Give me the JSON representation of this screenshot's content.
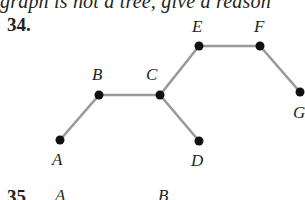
{
  "header_text": "graph is not a tree, give a reason",
  "problem": {
    "number": "34.",
    "nodes": [
      {
        "id": "A",
        "label": "A",
        "x": 60,
        "y": 140,
        "lx": 52,
        "ly": 165
      },
      {
        "id": "B",
        "label": "B",
        "x": 99,
        "y": 95,
        "lx": 92,
        "ly": 80
      },
      {
        "id": "C",
        "label": "C",
        "x": 160,
        "y": 95,
        "lx": 146,
        "ly": 80
      },
      {
        "id": "D",
        "label": "D",
        "x": 199,
        "y": 141,
        "lx": 191,
        "ly": 166
      },
      {
        "id": "E",
        "label": "E",
        "x": 199,
        "y": 46,
        "lx": 192,
        "ly": 32
      },
      {
        "id": "F",
        "label": "F",
        "x": 260,
        "y": 46,
        "lx": 254,
        "ly": 32
      },
      {
        "id": "G",
        "label": "G",
        "x": 300,
        "y": 92,
        "lx": 293,
        "ly": 118
      }
    ],
    "edges": [
      [
        "A",
        "B"
      ],
      [
        "B",
        "C"
      ],
      [
        "C",
        "E"
      ],
      [
        "E",
        "F"
      ],
      [
        "F",
        "G"
      ],
      [
        "C",
        "D"
      ]
    ]
  },
  "next_problem": {
    "number": "35.",
    "labels": [
      "A",
      "B"
    ]
  }
}
